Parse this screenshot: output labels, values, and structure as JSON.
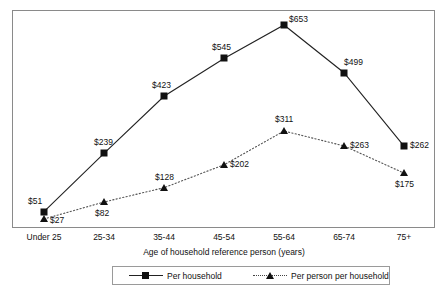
{
  "chart_data": {
    "type": "line",
    "title": "",
    "subtitle": "",
    "xlabel": "Age of household reference person (years)",
    "ylabel": "",
    "categories": [
      "Under 25",
      "25-34",
      "35-44",
      "45-54",
      "55-64",
      "65-74",
      "75+"
    ],
    "series": [
      {
        "name": "Per household",
        "marker": "square",
        "line_style": "solid",
        "color": "#111111",
        "values": [
          51,
          239,
          423,
          545,
          653,
          499,
          262
        ],
        "labels": [
          "$51",
          "$239",
          "$423",
          "$545",
          "$653",
          "$499",
          "$262"
        ]
      },
      {
        "name": "Per person per household",
        "marker": "triangle",
        "line_style": "dotted",
        "color": "#111111",
        "values": [
          27,
          82,
          128,
          202,
          311,
          263,
          175
        ],
        "labels": [
          "$27",
          "$82",
          "$128",
          "$202",
          "$311",
          "$263",
          "$175"
        ]
      }
    ],
    "ylim": [
      0,
      700
    ],
    "grid": false,
    "legend_position": "bottom",
    "axis_color": "#8a8a8a"
  },
  "legend": {
    "entries": [
      {
        "label": "Per household"
      },
      {
        "label": "Per person per household"
      }
    ]
  },
  "axis": {
    "x_title": "Age of household reference person (years)",
    "ticks": [
      "Under 25",
      "25-34",
      "35-44",
      "45-54",
      "55-64",
      "65-74",
      "75+"
    ]
  },
  "labels": {
    "series1": [
      "$51",
      "$239",
      "$423",
      "$545",
      "$653",
      "$499",
      "$262"
    ],
    "series2": [
      "$27",
      "$82",
      "$128",
      "$202",
      "$311",
      "$263",
      "$175"
    ]
  }
}
